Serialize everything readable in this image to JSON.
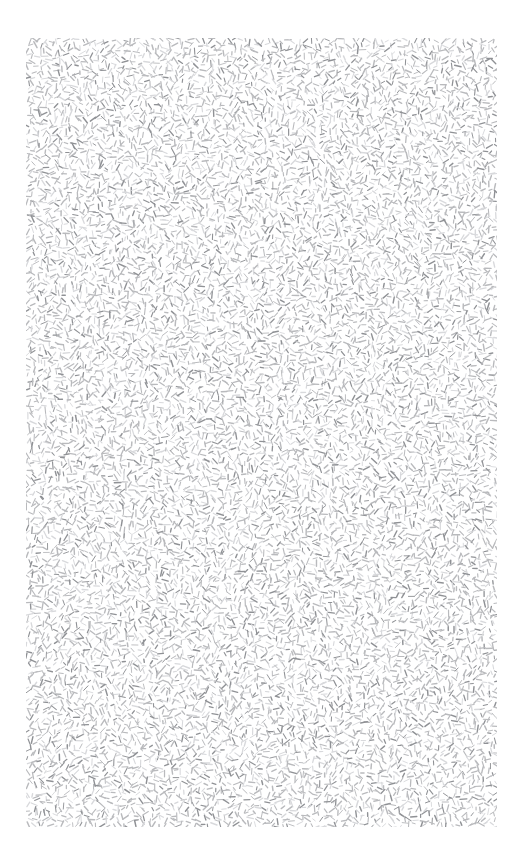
{
  "image": {
    "kind": "texture-field",
    "description": "Field of short randomly-oriented gray strokes on a white page",
    "width": 522,
    "height": 862,
    "background_color": "#ffffff"
  },
  "texture": {
    "name": "random-orientation-stroke-texture",
    "region": {
      "x": 26,
      "y": 38,
      "width": 471,
      "height": 789
    },
    "margins": {
      "left": 26,
      "top": 38,
      "right": 25,
      "bottom": 35
    },
    "element_shape": "line-segment",
    "element_count": 7200,
    "stroke_color": "#b9babd",
    "stroke_color_dark": "#8f9195",
    "stroke_color_light": "#d8d9dc",
    "stroke_width_min": 0.9,
    "stroke_width_max": 1.5,
    "segment_length_min": 3,
    "segment_length_max": 7,
    "orientation_range_deg": [
      0,
      360
    ],
    "distribution": "uniform-jittered-grid",
    "grid_spacing": 5.3,
    "jitter": 2.4,
    "density_per_sq_px": 0.0194,
    "seed": 20240517
  }
}
